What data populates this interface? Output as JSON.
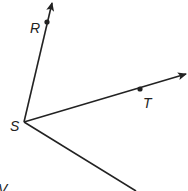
{
  "diagram": {
    "type": "geometry-rays",
    "vertex": {
      "label": "S",
      "x": 24,
      "y": 122
    },
    "rays": [
      {
        "name": "ray-SR",
        "point_label": "R",
        "point": {
          "x": 47,
          "y": 22
        },
        "end": {
          "x": 52,
          "y": 3
        },
        "arrow": true
      },
      {
        "name": "ray-ST",
        "point_label": "T",
        "point": {
          "x": 140,
          "y": 89
        },
        "end": {
          "x": 187,
          "y": 74
        },
        "arrow": true
      },
      {
        "name": "ray-SV",
        "point_label": "V",
        "end": {
          "x": 136,
          "y": 191
        },
        "arrow": false
      }
    ],
    "labels": {
      "R": "R",
      "S": "S",
      "T": "T",
      "V": "V"
    },
    "colors": {
      "stroke": "#222222",
      "background": "#ffffff"
    }
  }
}
